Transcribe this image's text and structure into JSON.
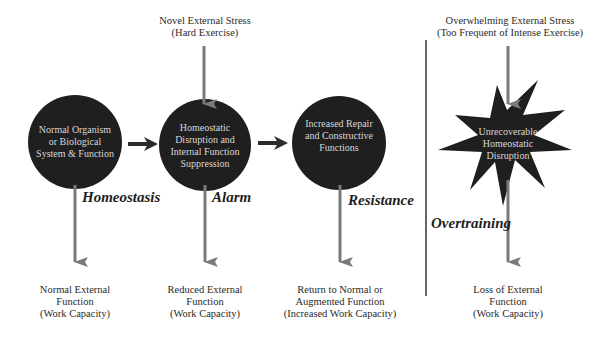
{
  "colors": {
    "node_fill": "#1f1f1f",
    "arrow_gray": "#7a7a7a",
    "arrow_dark": "#2b2b2b",
    "divider": "#333333",
    "inner_text": "#d8d8d8",
    "label_text": "#2a2a2a"
  },
  "stress_labels": {
    "novel": [
      "Novel External Stress",
      "(Hard Exercise)"
    ],
    "overwhelming": [
      "Overwhelming External Stress",
      "(Too Frequent of Intense Exercise)"
    ]
  },
  "nodes": [
    {
      "shape": "circle",
      "lines": [
        "Normal Organism",
        "or Biological",
        "System & Function"
      ],
      "stage": "Homeostasis",
      "outcome": [
        "Normal External",
        "Function",
        "(Work Capacity)"
      ]
    },
    {
      "shape": "circle",
      "lines": [
        "Homeostatic",
        "Disruption and",
        "Internal Function",
        "Suppression"
      ],
      "stage": "Alarm",
      "outcome": [
        "Reduced External",
        "Function",
        "(Work Capacity)"
      ]
    },
    {
      "shape": "circle",
      "lines": [
        "Increased Repair",
        "and Constructive",
        "Functions"
      ],
      "stage": "Resistance",
      "outcome": [
        "Return to Normal or",
        "Augmented Function",
        "(Increased Work Capacity)"
      ]
    },
    {
      "shape": "starburst",
      "lines": [
        "Unrecoverable",
        "Homeostatic",
        "Disruption"
      ],
      "stage": "Overtraining",
      "outcome": [
        "Loss of External",
        "Function",
        "(Work Capacity)"
      ]
    }
  ]
}
